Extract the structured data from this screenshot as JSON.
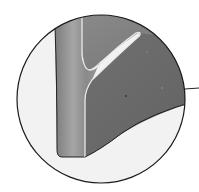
{
  "figure": {
    "type": "magnified-detail-callout",
    "colors": {
      "background": "#ffffff",
      "circle_fill": "#f0f0f0",
      "circle_stroke": "#1a1a1a",
      "stem_fill": "#8a8a8a",
      "body_fill": "#6e6e6e",
      "upper_fill": "#7a7a7a",
      "highlight": "#d8d8d8"
    },
    "labels": []
  }
}
